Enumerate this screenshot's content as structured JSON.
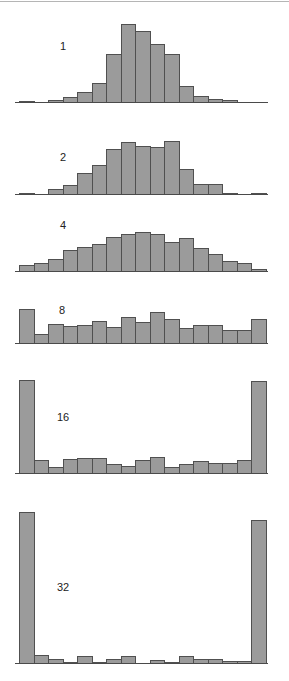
{
  "chart_data": [
    {
      "type": "bar",
      "title": "",
      "label": "1",
      "xlabel": "",
      "ylabel": "",
      "grid": false,
      "categories": [
        "b1",
        "b2",
        "b3",
        "b4",
        "b5",
        "b6",
        "b7",
        "b8",
        "b9",
        "b10",
        "b11",
        "b12",
        "b13",
        "b14",
        "b15",
        "b16",
        "b17"
      ],
      "values": [
        1,
        0,
        2,
        5,
        10,
        19,
        48,
        78,
        71,
        58,
        48,
        16,
        6,
        3,
        2,
        0,
        0
      ]
    },
    {
      "type": "bar",
      "title": "",
      "label": "2",
      "xlabel": "",
      "ylabel": "",
      "grid": false,
      "categories": [
        "b1",
        "b2",
        "b3",
        "b4",
        "b5",
        "b6",
        "b7",
        "b8",
        "b9",
        "b10",
        "b11",
        "b12",
        "b13",
        "b14",
        "b15",
        "b16",
        "b17"
      ],
      "values": [
        1,
        0,
        5,
        9,
        21,
        29,
        45,
        52,
        48,
        47,
        53,
        25,
        10,
        10,
        1,
        0,
        1
      ]
    },
    {
      "type": "bar",
      "title": "",
      "label": "4",
      "xlabel": "",
      "ylabel": "",
      "grid": false,
      "categories": [
        "b1",
        "b2",
        "b3",
        "b4",
        "b5",
        "b6",
        "b7",
        "b8",
        "b9",
        "b10",
        "b11",
        "b12",
        "b13",
        "b14",
        "b15",
        "b16",
        "b17"
      ],
      "values": [
        6,
        8,
        12,
        21,
        24,
        27,
        34,
        37,
        39,
        37,
        29,
        33,
        23,
        17,
        10,
        8,
        2
      ]
    },
    {
      "type": "bar",
      "title": "",
      "label": "8",
      "xlabel": "",
      "ylabel": "",
      "grid": false,
      "categories": [
        "b1",
        "b2",
        "b3",
        "b4",
        "b5",
        "b6",
        "b7",
        "b8",
        "b9",
        "b10",
        "b11",
        "b12",
        "b13",
        "b14",
        "b15",
        "b16",
        "b17"
      ],
      "values": [
        34,
        9,
        19,
        17,
        18,
        22,
        16,
        26,
        21,
        31,
        24,
        15,
        18,
        18,
        13,
        13,
        24
      ]
    },
    {
      "type": "bar",
      "title": "",
      "label": "16",
      "xlabel": "",
      "ylabel": "",
      "grid": false,
      "categories": [
        "b1",
        "b2",
        "b3",
        "b4",
        "b5",
        "b6",
        "b7",
        "b8",
        "b9",
        "b10",
        "b11",
        "b12",
        "b13",
        "b14",
        "b15",
        "b16",
        "b17"
      ],
      "values": [
        93,
        13,
        6,
        14,
        15,
        15,
        9,
        7,
        13,
        16,
        6,
        9,
        12,
        10,
        10,
        13,
        92
      ]
    },
    {
      "type": "bar",
      "title": "",
      "label": "32",
      "xlabel": "",
      "ylabel": "",
      "grid": false,
      "categories": [
        "b1",
        "b2",
        "b3",
        "b4",
        "b5",
        "b6",
        "b7",
        "b8",
        "b9",
        "b10",
        "b11",
        "b12",
        "b13",
        "b14",
        "b15",
        "b16",
        "b17"
      ],
      "values": [
        151,
        8,
        4,
        1,
        7,
        1,
        4,
        7,
        0,
        3,
        1,
        7,
        4,
        4,
        2,
        2,
        143
      ]
    }
  ],
  "panels": [
    {
      "label": "1"
    },
    {
      "label": "2"
    },
    {
      "label": "4"
    },
    {
      "label": "8"
    },
    {
      "label": "16"
    },
    {
      "label": "32"
    }
  ],
  "colors": {
    "bar_fill": "#9b9b9b",
    "bar_edge": "#505050",
    "axis": "#4a4a4a"
  }
}
